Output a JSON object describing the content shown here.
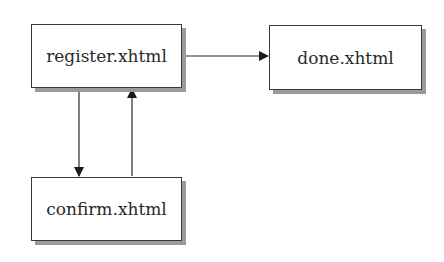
{
  "diagram": {
    "type": "flowchart",
    "nodes": [
      {
        "id": "register",
        "label": "register.xhtml"
      },
      {
        "id": "done",
        "label": "done.xhtml"
      },
      {
        "id": "confirm",
        "label": "confirm.xhtml"
      }
    ],
    "edges": [
      {
        "from": "register",
        "to": "done"
      },
      {
        "from": "register",
        "to": "confirm"
      },
      {
        "from": "confirm",
        "to": "register"
      }
    ],
    "colors": {
      "stroke": "#2a2a2a",
      "shadow": "#9a9a9a",
      "fill": "#ffffff"
    }
  }
}
